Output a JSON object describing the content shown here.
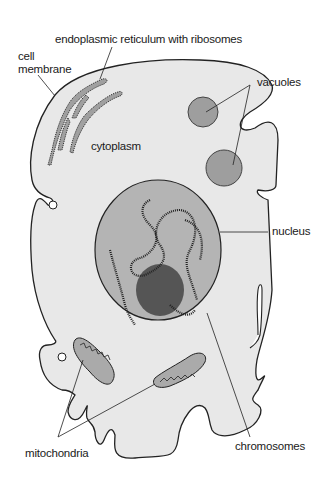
{
  "diagram": {
    "labels": {
      "er": "endoplasmic reticulum with ribosomes",
      "membrane_line1": "cell",
      "membrane_line2": "membrane",
      "vacuoles": "vacuoles",
      "cytoplasm": "cytoplasm",
      "nucleus": "nucleus",
      "mitochondria": "mitochondria",
      "chromosomes": "chromosomes"
    },
    "colors": {
      "cytoplasm": "#e8e8e8",
      "organelle": "#a8a8a8",
      "nucleus": "#b0b0b0",
      "outline": "#222222"
    }
  }
}
